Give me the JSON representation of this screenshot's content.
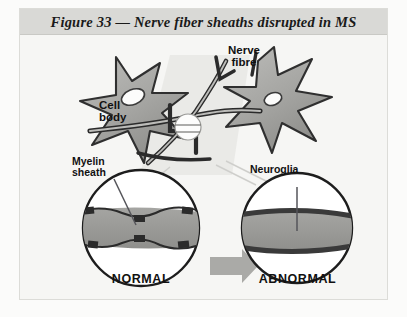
{
  "figure": {
    "title": "Figure 33 — Nerve fiber sheaths disrupted in MS",
    "labels": {
      "cell_body": "Cell\nbody",
      "nerve_fibre": "Nerve\nfibre",
      "myelin_sheath": "Myelin\nsheath",
      "neuroglia": "Neuroglia",
      "normal": "NORMAL",
      "abnormal": "ABNORMAL"
    },
    "colors": {
      "page_background": "#fbfbfa",
      "panel_background": "#f6f6f4",
      "title_band": "#d9d9d6",
      "cell_fill": "#a9a9a6",
      "fibre_outline": "#2b2b2b",
      "myelin_band": "#9a9a97",
      "arrow": "#aaaaa7",
      "circle_outline": "#1d1d1d",
      "circle_fill": "#ffffff",
      "text": "#111111"
    }
  }
}
